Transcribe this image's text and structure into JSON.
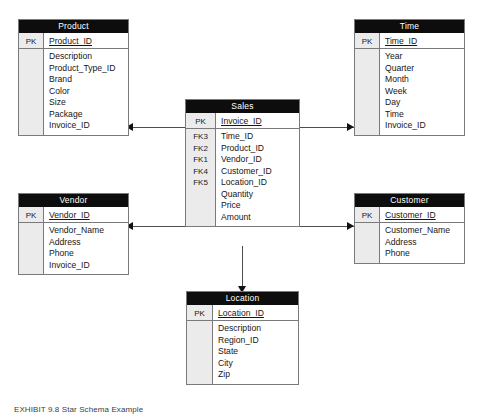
{
  "diagram": {
    "type": "star-schema-er-diagram",
    "caption": "EXHIBIT 9.8 Star Schema Example",
    "fact_table": "Sales",
    "colors": {
      "header_bg": "#0d0d0d",
      "header_text": "#ffffff",
      "key_column_bg": "#ebebeb",
      "border": "#7a7a7a",
      "connector": "#4d4d4d",
      "arrow": "#111111",
      "page_bg": "#ffffff"
    }
  },
  "entities": {
    "product": {
      "title": "Product",
      "pk_tag": "PK",
      "pk_field": "Product_ID",
      "key_tags": [
        "",
        "",
        "",
        "",
        "",
        "",
        ""
      ],
      "fields": [
        "Description",
        "Product_Type_ID",
        "Brand",
        "Color",
        "Size",
        "Package",
        "Invoice_ID"
      ]
    },
    "time": {
      "title": "Time",
      "pk_tag": "PK",
      "pk_field": "Time_ID",
      "key_tags": [
        "",
        "",
        "",
        "",
        "",
        "",
        ""
      ],
      "fields": [
        "Year",
        "Quarter",
        "Month",
        "Week",
        "Day",
        "Time",
        "Invoice_ID"
      ]
    },
    "sales": {
      "title": "Sales",
      "pk_tag": "PK",
      "pk_field": "Invoice_ID",
      "key_tags": [
        "FK3",
        "FK2",
        "FK1",
        "FK4",
        "FK5",
        "",
        "",
        ""
      ],
      "fields": [
        "Time_ID",
        "Product_ID",
        "Vendor_ID",
        "Customer_ID",
        "Location_ID",
        "Quantity",
        "Price",
        "Amount"
      ]
    },
    "vendor": {
      "title": "Vendor",
      "pk_tag": "PK",
      "pk_field": "Vendor_ID",
      "key_tags": [
        "",
        "",
        "",
        ""
      ],
      "fields": [
        "Vendor_Name",
        "Address",
        "Phone",
        "Invoice_ID"
      ]
    },
    "customer": {
      "title": "Customer",
      "pk_tag": "PK",
      "pk_field": "Customer_ID",
      "key_tags": [
        "",
        "",
        ""
      ],
      "fields": [
        "Customer_Name",
        "Address",
        "Phone"
      ]
    },
    "location": {
      "title": "Location",
      "pk_tag": "PK",
      "pk_field": "Location_ID",
      "key_tags": [
        "",
        "",
        "",
        "",
        ""
      ],
      "fields": [
        "Description",
        "Region_ID",
        "State",
        "City",
        "Zip"
      ]
    }
  },
  "relationships": [
    {
      "from": "Sales",
      "to": "Product",
      "direction": "left"
    },
    {
      "from": "Sales",
      "to": "Time",
      "direction": "right"
    },
    {
      "from": "Sales",
      "to": "Vendor",
      "direction": "left"
    },
    {
      "from": "Sales",
      "to": "Customer",
      "direction": "right"
    },
    {
      "from": "Sales",
      "to": "Location",
      "direction": "down"
    }
  ]
}
